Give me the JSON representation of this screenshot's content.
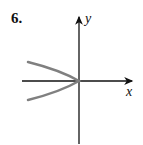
{
  "problem": {
    "number": "6."
  },
  "axes": {
    "x_label": "x",
    "y_label": "y"
  },
  "colors": {
    "axis": "#111111",
    "curve": "#808080"
  },
  "curve": {
    "description": "parabola opening left, vertex at origin",
    "equation_shape": "x = -y^2"
  }
}
